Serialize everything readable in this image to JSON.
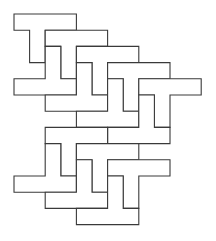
{
  "figure": {
    "stroke_color": "#3a3a3a",
    "background_color": "#ffffff",
    "grid": {
      "origin_x": 14,
      "origin_y": 14,
      "unit_x": 15.6,
      "unit_y": 16.2
    },
    "tiles": [
      {
        "id": "t1",
        "shape": "T-down",
        "col": 0,
        "row": 0
      },
      {
        "id": "t2",
        "shape": "T-down",
        "col": 2,
        "row": 1
      },
      {
        "id": "t3",
        "shape": "T-down",
        "col": 4,
        "row": 2
      },
      {
        "id": "t4",
        "shape": "T-down",
        "col": 6,
        "row": 3
      },
      {
        "id": "t5",
        "shape": "T-down",
        "col": 8,
        "row": 4
      },
      {
        "id": "u1",
        "shape": "T-up",
        "col": 0,
        "row": 4
      },
      {
        "id": "u2",
        "shape": "T-up",
        "col": 2,
        "row": 5
      },
      {
        "id": "u3",
        "shape": "T-up",
        "col": 4,
        "row": 6
      },
      {
        "id": "u4",
        "shape": "T-up",
        "col": 6,
        "row": 7
      },
      {
        "id": "t6",
        "shape": "T-down",
        "col": 2,
        "row": 7
      },
      {
        "id": "t7",
        "shape": "T-down",
        "col": 4,
        "row": 8
      },
      {
        "id": "t8",
        "shape": "T-down",
        "col": 6,
        "row": 9
      },
      {
        "id": "u5",
        "shape": "T-up",
        "col": 0,
        "row": 10
      },
      {
        "id": "u6",
        "shape": "T-up",
        "col": 2,
        "row": 11
      },
      {
        "id": "u7",
        "shape": "T-up",
        "col": 4,
        "row": 12
      }
    ]
  }
}
